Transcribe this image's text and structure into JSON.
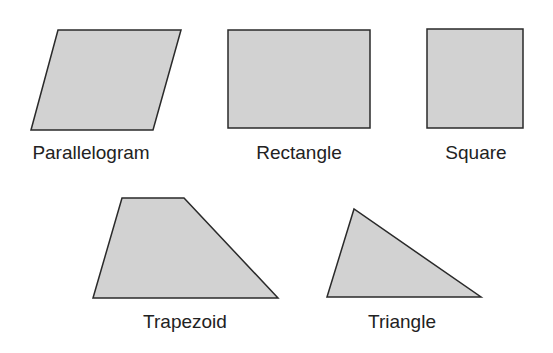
{
  "diagram": {
    "colors": {
      "fill": "#d2d2d2",
      "stroke": "#2a2a2a",
      "text": "#222222",
      "background": "#ffffff"
    },
    "shapes": [
      {
        "name": "Parallelogram",
        "label": "Parallelogram",
        "points": "31,130 58,30 181,30 153,130",
        "label_x": 91,
        "label_y": 143
      },
      {
        "name": "Rectangle",
        "label": "Rectangle",
        "points": "228,30 370,30 370,128 228,128",
        "label_x": 299,
        "label_y": 143
      },
      {
        "name": "Square",
        "label": "Square",
        "points": "427,29 523,29 523,128 427,128",
        "label_x": 476,
        "label_y": 143
      },
      {
        "name": "Trapezoid",
        "label": "Trapezoid",
        "points": "93,298 122,198 184,198 278,298",
        "label_x": 185,
        "label_y": 312
      },
      {
        "name": "Triangle",
        "label": "Triangle",
        "points": "327,297 354,209 481,297",
        "label_x": 402,
        "label_y": 312
      }
    ]
  }
}
